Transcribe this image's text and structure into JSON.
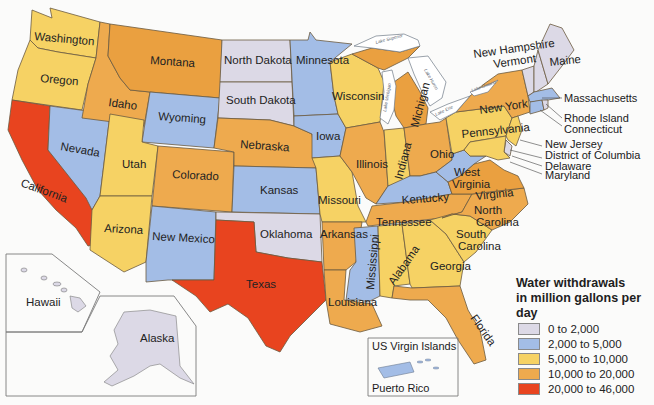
{
  "map": {
    "title": "Water withdrawals in million gallons per day",
    "legend": {
      "title_line1": "Water withdrawals",
      "title_line2": "in million gallons per day",
      "items": [
        {
          "label": "0 to 2,000",
          "color": "#dcd9e6"
        },
        {
          "label": "2,000 to 5,000",
          "color": "#a3bde6"
        },
        {
          "label": "5,000 to 10,000",
          "color": "#f6d264"
        },
        {
          "label": "10,000 to 20,000",
          "color": "#eeaa4e"
        },
        {
          "label": "20,000 to 46,000",
          "color": "#e8441f"
        }
      ]
    },
    "states": {
      "washington": "Washington",
      "oregon": "Oregon",
      "california": "California",
      "nevada": "Nevada",
      "idaho": "Idaho",
      "montana": "Montana",
      "wyoming": "Wyoming",
      "utah": "Utah",
      "arizona": "Arizona",
      "colorado": "Colorado",
      "new_mexico": "New Mexico",
      "north_dakota": "North Dakota",
      "south_dakota": "South Dakota",
      "nebraska": "Nebraska",
      "kansas": "Kansas",
      "oklahoma": "Oklahoma",
      "texas": "Texas",
      "minnesota": "Minnesota",
      "iowa": "Iowa",
      "missouri": "Missouri",
      "arkansas": "Arkansas",
      "louisiana": "Louisiana",
      "wisconsin": "Wisconsin",
      "illinois": "Illinois",
      "michigan": "Michigan",
      "indiana": "Indiana",
      "ohio": "Ohio",
      "kentucky": "Kentucky",
      "tennessee": "Tennessee",
      "mississippi": "Mississippi",
      "alabama": "Alabama",
      "georgia": "Georgia",
      "florida": "Florida",
      "south_carolina_1": "South",
      "south_carolina_2": "Carolina",
      "north_carolina_1": "North",
      "north_carolina_2": "Carolina",
      "virginia": "Virginia",
      "west_virginia_1": "West",
      "west_virginia_2": "Virginia",
      "pennsylvania": "Pennsylvania",
      "new_york": "New York",
      "maine": "Maine",
      "new_hampshire": "New Hampshire",
      "vermont": "Vermont",
      "massachusetts": "Massachusetts",
      "rhode_island": "Rhode Island",
      "connecticut": "Connecticut",
      "new_jersey": "New Jersey",
      "district_of_columbia": "District of Columbia",
      "delaware": "Delaware",
      "maryland": "Maryland",
      "hawaii": "Hawaii",
      "alaska": "Alaska",
      "us_virgin_islands": "US Virgin Islands",
      "puerto_rico": "Puerto Rico"
    },
    "lakes": {
      "superior": "Lake Superior",
      "michigan": "Lake Michigan",
      "huron": "Lake Huron",
      "erie": "Lake Erie",
      "ontario": "Lake Ontario"
    },
    "categories": {
      "washington": 2,
      "oregon": 2,
      "california": 4,
      "nevada": 1,
      "idaho": 3,
      "montana": 3,
      "wyoming": 1,
      "utah": 2,
      "arizona": 2,
      "colorado": 3,
      "new_mexico": 1,
      "north_dakota": 0,
      "south_dakota": 0,
      "nebraska": 3,
      "kansas": 1,
      "oklahoma": 0,
      "texas": 4,
      "minnesota": 1,
      "iowa": 1,
      "missouri": 2,
      "arkansas": 3,
      "louisiana": 3,
      "wisconsin": 2,
      "illinois": 3,
      "michigan": 3,
      "indiana": 2,
      "ohio": 3,
      "kentucky": 1,
      "tennessee": 3,
      "mississippi": 1,
      "alabama": 2,
      "georgia": 2,
      "florida": 3,
      "south_carolina": 2,
      "north_carolina": 3,
      "virginia": 3,
      "west_virginia": 1,
      "pennsylvania": 2,
      "new_york": 3,
      "maine": 0,
      "new_hampshire": 0,
      "vermont": 0,
      "massachusetts": 1,
      "rhode_island": 0,
      "connecticut": 1,
      "new_jersey": 2,
      "delaware": 0,
      "maryland": 2,
      "hawaii": 0,
      "alaska": 0,
      "puerto_rico": 1
    }
  }
}
